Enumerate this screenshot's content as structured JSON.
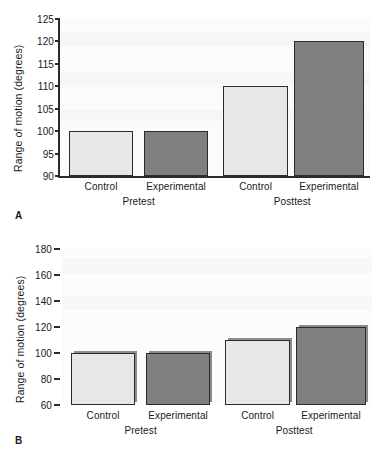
{
  "figure": {
    "panels": [
      {
        "letter": "A",
        "ylabel": "Range of motion (degrees)",
        "yticks": [
          90,
          95,
          100,
          105,
          110,
          115,
          120,
          125
        ],
        "ylim": [
          90,
          125
        ],
        "groups": [
          "Pretest",
          "Posttest"
        ],
        "bar_labels": [
          "Control",
          "Experimental",
          "Control",
          "Experimental"
        ],
        "bar_values": [
          100,
          100,
          110,
          120
        ],
        "bar_styles": [
          "light",
          "dark",
          "light",
          "dark"
        ]
      },
      {
        "letter": "B",
        "ylabel": "Range of motion (degrees)",
        "yticks": [
          60,
          80,
          100,
          120,
          140,
          160,
          180
        ],
        "ylim": [
          60,
          180
        ],
        "groups": [
          "Pretest",
          "Posttest"
        ],
        "bar_labels": [
          "Control",
          "Experimental",
          "Control",
          "Experimental"
        ],
        "bar_values": [
          100,
          100,
          110,
          120
        ],
        "bar_styles": [
          "light",
          "dark",
          "light",
          "dark"
        ]
      }
    ]
  },
  "colors": {
    "light_bar": "#e7e7e7",
    "dark_bar": "#808080",
    "axis": "#2b2b2b",
    "plot_background": "#fbfbfb"
  },
  "chart_data": [
    {
      "type": "bar",
      "panel": "A",
      "title": "",
      "xlabel": "",
      "ylabel": "Range of motion (degrees)",
      "categories": [
        "Pretest Control",
        "Pretest Experimental",
        "Posttest Control",
        "Posttest Experimental"
      ],
      "tick_labels": [
        "Control",
        "Experimental",
        "Control",
        "Experimental"
      ],
      "group_labels": [
        "Pretest",
        "Posttest"
      ],
      "values": [
        100,
        100,
        110,
        120
      ],
      "ylim": [
        90,
        125
      ],
      "yticks": [
        90,
        95,
        100,
        105,
        110,
        115,
        120,
        125
      ],
      "grid": false,
      "legend": "none",
      "bar_colors": [
        "#e7e7e7",
        "#808080",
        "#e7e7e7",
        "#808080"
      ]
    },
    {
      "type": "bar",
      "panel": "B",
      "title": "",
      "xlabel": "",
      "ylabel": "Range of motion (degrees)",
      "categories": [
        "Pretest Control",
        "Pretest Experimental",
        "Posttest Control",
        "Posttest Experimental"
      ],
      "tick_labels": [
        "Control",
        "Experimental",
        "Control",
        "Experimental"
      ],
      "group_labels": [
        "Pretest",
        "Posttest"
      ],
      "values": [
        100,
        100,
        110,
        120
      ],
      "ylim": [
        60,
        180
      ],
      "yticks": [
        60,
        80,
        100,
        120,
        140,
        160,
        180
      ],
      "grid": false,
      "legend": "none",
      "bar_colors": [
        "#e7e7e7",
        "#808080",
        "#e7e7e7",
        "#808080"
      ]
    }
  ]
}
